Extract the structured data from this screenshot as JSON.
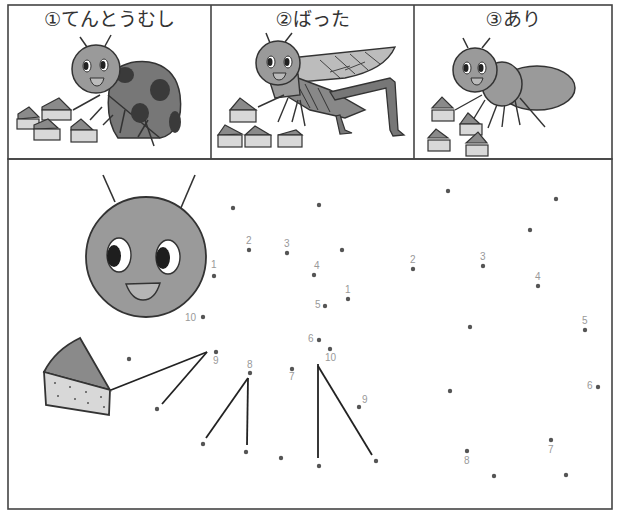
{
  "worksheet": {
    "panels": [
      {
        "id": "ladybug",
        "title": "①てんとうむし"
      },
      {
        "id": "grasshopper",
        "title": "②ばった"
      },
      {
        "id": "ant",
        "title": "③あり"
      }
    ],
    "colors": {
      "border": "#444444",
      "body_gray": "#9a9a9a",
      "dark_gray": "#777777",
      "spot": "#3a3a3a",
      "cake_top": "#8a8a8a",
      "cake_side": "#d8d8d8",
      "dot": "#555555",
      "label": "#999999"
    },
    "dot_puzzle": {
      "dots": [
        {
          "x": 214,
          "y": 276,
          "label": "1",
          "lx": 211,
          "ly": 268
        },
        {
          "x": 249,
          "y": 250,
          "label": "2",
          "lx": 246,
          "ly": 244
        },
        {
          "x": 287,
          "y": 253,
          "label": "3",
          "lx": 284,
          "ly": 247
        },
        {
          "x": 314,
          "y": 275,
          "label": "4",
          "lx": 314,
          "ly": 269
        },
        {
          "x": 325,
          "y": 306,
          "label": "5",
          "lx": 315,
          "ly": 308
        },
        {
          "x": 319,
          "y": 340,
          "label": "6",
          "lx": 308,
          "ly": 342
        },
        {
          "x": 292,
          "y": 369,
          "label": "7",
          "lx": 289,
          "ly": 380
        },
        {
          "x": 250,
          "y": 373,
          "label": "8",
          "lx": 247,
          "ly": 368
        },
        {
          "x": 216,
          "y": 352,
          "label": "9",
          "lx": 213,
          "ly": 364
        },
        {
          "x": 203,
          "y": 317,
          "label": "10",
          "lx": 185,
          "ly": 321
        },
        {
          "x": 348,
          "y": 299,
          "label": "1",
          "lx": 345,
          "ly": 293
        },
        {
          "x": 413,
          "y": 269,
          "label": "2",
          "lx": 410,
          "ly": 263
        },
        {
          "x": 483,
          "y": 266,
          "label": "3",
          "lx": 480,
          "ly": 260
        },
        {
          "x": 538,
          "y": 286,
          "label": "4",
          "lx": 535,
          "ly": 280
        },
        {
          "x": 585,
          "y": 330,
          "label": "5",
          "lx": 582,
          "ly": 324
        },
        {
          "x": 598,
          "y": 387,
          "label": "6",
          "lx": 587,
          "ly": 389
        },
        {
          "x": 551,
          "y": 440,
          "label": "7",
          "lx": 548,
          "ly": 453
        },
        {
          "x": 467,
          "y": 451,
          "label": "8",
          "lx": 464,
          "ly": 464
        },
        {
          "x": 359,
          "y": 407,
          "label": "9",
          "lx": 362,
          "ly": 403
        },
        {
          "x": 330,
          "y": 349,
          "label": "10",
          "lx": 325,
          "ly": 361
        },
        {
          "x": 233,
          "y": 208,
          "label": ""
        },
        {
          "x": 319,
          "y": 205,
          "label": ""
        },
        {
          "x": 342,
          "y": 250,
          "label": ""
        },
        {
          "x": 129,
          "y": 359,
          "label": ""
        },
        {
          "x": 157,
          "y": 409,
          "label": ""
        },
        {
          "x": 203,
          "y": 444,
          "label": ""
        },
        {
          "x": 246,
          "y": 452,
          "label": ""
        },
        {
          "x": 281,
          "y": 458,
          "label": ""
        },
        {
          "x": 319,
          "y": 466,
          "label": ""
        },
        {
          "x": 376,
          "y": 461,
          "label": ""
        },
        {
          "x": 448,
          "y": 191,
          "label": ""
        },
        {
          "x": 556,
          "y": 199,
          "label": ""
        },
        {
          "x": 530,
          "y": 230,
          "label": ""
        },
        {
          "x": 470,
          "y": 327,
          "label": ""
        },
        {
          "x": 450,
          "y": 391,
          "label": ""
        },
        {
          "x": 494,
          "y": 476,
          "label": ""
        },
        {
          "x": 566,
          "y": 475,
          "label": ""
        }
      ]
    }
  }
}
